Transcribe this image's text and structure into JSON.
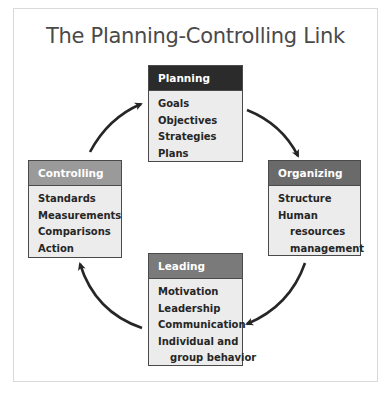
{
  "title": "The Planning-Controlling Link",
  "boxes": {
    "planning": {
      "header": "Planning",
      "header_color": "#2b2b2b",
      "items": [
        "Goals",
        "Objectives",
        "Strategies",
        "Plans"
      ]
    },
    "organizing": {
      "header": "Organizing",
      "header_color": "#6a6a6a",
      "items": [
        "Structure",
        "Human",
        "resources",
        "management"
      ]
    },
    "leading": {
      "header": "Leading",
      "header_color": "#7a7a7a",
      "items": [
        "Motivation",
        "Leadership",
        "Communication",
        "Individual and",
        "group behavior"
      ]
    },
    "controlling": {
      "header": "Controlling",
      "header_color": "#9a9a9a",
      "items": [
        "Standards",
        "Measurements",
        "Comparisons",
        "Action"
      ]
    }
  },
  "flow": [
    "Planning",
    "Organizing",
    "Leading",
    "Controlling",
    "Planning"
  ]
}
